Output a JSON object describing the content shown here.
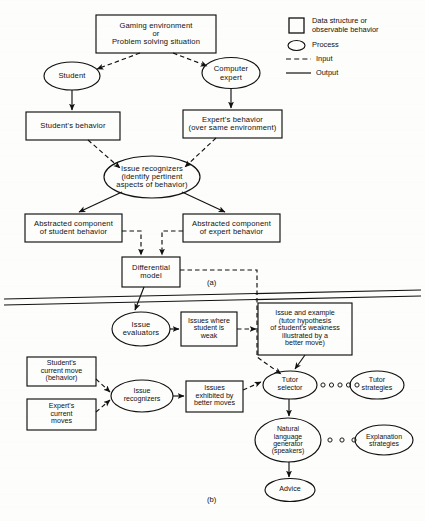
{
  "figure": {
    "panel_a_label": "(a)",
    "panel_b_label": "(b)"
  },
  "legend": {
    "items": [
      {
        "icon": "rectangle-icon",
        "label": "Data structure or\nobservable behavior"
      },
      {
        "icon": "ellipse-icon",
        "label": "Process"
      },
      {
        "icon": "dashed-line-icon",
        "label": "Input"
      },
      {
        "icon": "solid-line-icon",
        "label": "Output"
      }
    ]
  },
  "panel_a": {
    "nodes": [
      {
        "id": "gaming-environment",
        "shape": "box",
        "label": "Gaming environment\nor\nProblem solving situation"
      },
      {
        "id": "student",
        "shape": "ellipse",
        "label": "Student"
      },
      {
        "id": "computer-expert",
        "shape": "ellipse",
        "label": "Computer\nexpert"
      },
      {
        "id": "students-behavior",
        "shape": "box",
        "label": "Student's behavior"
      },
      {
        "id": "experts-behavior",
        "shape": "box",
        "label": "Expert's behavior\n(over same environment)"
      },
      {
        "id": "issue-recognizers",
        "shape": "ellipse",
        "label": "Issue recognizers\n(identify pertinent\naspects of behavior)"
      },
      {
        "id": "abstracted-student",
        "shape": "box",
        "label": "Abstracted component\nof student behavior"
      },
      {
        "id": "abstracted-expert",
        "shape": "box",
        "label": "Abstracted component\nof expert behavior"
      },
      {
        "id": "differential-model",
        "shape": "box",
        "label": "Differential\nmodel"
      }
    ]
  },
  "panel_b": {
    "nodes": [
      {
        "id": "issue-evaluators",
        "shape": "ellipse",
        "label": "Issue\nevaluators"
      },
      {
        "id": "issues-where-weak",
        "shape": "box",
        "label": "Issues where\nstudent is\nweak"
      },
      {
        "id": "issue-and-example",
        "shape": "box",
        "label": "Issue and example\n(tutor hypothesis\nof student's weakness\nillustrated by a\nbetter move)"
      },
      {
        "id": "students-current-move",
        "shape": "box",
        "label": "Student's\ncurrent move\n(behavior)"
      },
      {
        "id": "experts-current-moves",
        "shape": "box",
        "label": "Expert's\ncurrent\nmoves"
      },
      {
        "id": "issue-recognizers-b",
        "shape": "ellipse",
        "label": "Issue\nrecognizers"
      },
      {
        "id": "issues-exhibited",
        "shape": "box",
        "label": "Issues\nexhibited by\nbetter moves"
      },
      {
        "id": "tutor-selector",
        "shape": "ellipse",
        "label": "Tutor\nselector"
      },
      {
        "id": "tutor-strategies",
        "shape": "ellipse",
        "label": "Tutor\nstrategies"
      },
      {
        "id": "natural-language-generator",
        "shape": "ellipse",
        "label": "Natural\nlanguage\ngenerator\n(speakers)"
      },
      {
        "id": "explanation-strategies",
        "shape": "ellipse",
        "label": "Explanation\nstrategies"
      },
      {
        "id": "advice",
        "shape": "ellipse",
        "label": "Advice"
      }
    ]
  },
  "colors": {
    "ink": "#111111",
    "paper": "#fdfdfb"
  }
}
